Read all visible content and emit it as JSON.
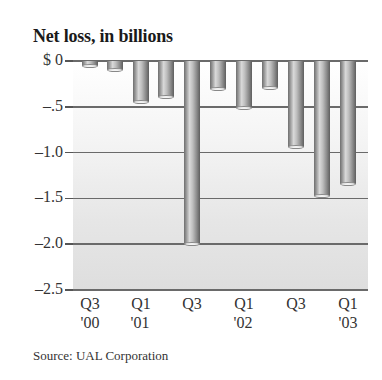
{
  "chart_data": {
    "type": "bar",
    "title": "Net loss, in billions",
    "xlabel": "",
    "ylabel": "Net loss, in billions",
    "ylim": [
      -2.5,
      0
    ],
    "grid": true,
    "legend": null,
    "categories": [
      "Q3 '00",
      "Q4 '00",
      "Q1 '01",
      "Q2 '01",
      "Q3 '01",
      "Q4 '01",
      "Q1 '02",
      "Q2 '02",
      "Q3 '02",
      "Q4 '02",
      "Q1 '03"
    ],
    "values": [
      -0.05,
      -0.1,
      -0.45,
      -0.39,
      -2.0,
      -0.31,
      -0.51,
      -0.29,
      -0.94,
      -1.47,
      -1.34
    ],
    "y_ticks": [
      "$ 0",
      "–.5",
      "–1.0",
      "–1.5",
      "–2.0",
      "–2.5"
    ],
    "y_tick_values": [
      0,
      -0.5,
      -1.0,
      -1.5,
      -2.0,
      -2.5
    ],
    "x_tick_labels": [
      {
        "quarter": "Q3",
        "year": "'00"
      },
      {
        "quarter": "Q1",
        "year": "'01"
      },
      {
        "quarter": "Q3",
        "year": ""
      },
      {
        "quarter": "Q1",
        "year": "'02"
      },
      {
        "quarter": "Q3",
        "year": ""
      },
      {
        "quarter": "Q1",
        "year": "'03"
      }
    ],
    "source": "Source: UAL Corporation"
  },
  "colors": {
    "bar_dark": "#6e6e6e",
    "bar_highlight": "#d9d9d9",
    "gridline": "#6a6a6a",
    "background_top": "#ffffff",
    "background_bottom": "#dedede"
  }
}
